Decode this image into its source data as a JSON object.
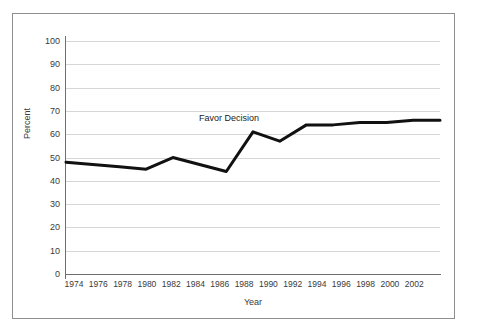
{
  "chart_data": {
    "type": "line",
    "title": "",
    "xlabel": "Year",
    "ylabel": "Percent",
    "xlim": [
      1974,
      2002
    ],
    "ylim": [
      0,
      100
    ],
    "grid": true,
    "legend_position": "none",
    "x": [
      1974,
      1976,
      1978,
      1980,
      1982,
      1984,
      1986,
      1988,
      1990,
      1992,
      1994,
      1996,
      1998,
      2000,
      2002
    ],
    "xtick_labels": [
      "1974",
      "1976",
      "1978",
      "1980",
      "1982",
      "1984",
      "1986",
      "1988",
      "1990",
      "1992",
      "1994",
      "1996",
      "1998",
      "2000",
      "2002"
    ],
    "ytick_labels": [
      "0",
      "10",
      "20",
      "30",
      "40",
      "50",
      "60",
      "70",
      "80",
      "90",
      "100"
    ],
    "ytick_values": [
      0,
      10,
      20,
      30,
      40,
      50,
      60,
      70,
      80,
      90,
      100
    ],
    "series": [
      {
        "name": "Favor Decision",
        "color": "#111111",
        "values": [
          48,
          47,
          46,
          45,
          50,
          47,
          44,
          61,
          57,
          64,
          64,
          65,
          65,
          66,
          66
        ]
      }
    ],
    "annotations": [
      {
        "text": "Favor Decision",
        "x": 1986,
        "y": 70
      }
    ]
  }
}
